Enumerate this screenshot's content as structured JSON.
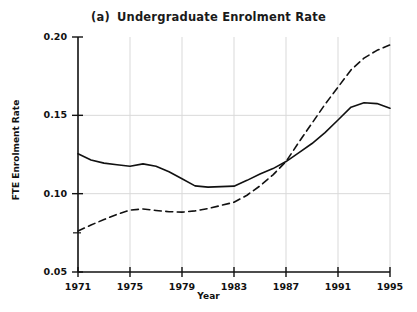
{
  "chart_data": {
    "type": "line",
    "panel_label": "(a)",
    "title_text": "Undergraduate Enrolment Rate",
    "xlabel": "Year",
    "ylabel": "FTE Enrolment Rate",
    "xlim": [
      1971,
      1995
    ],
    "ylim": [
      0.05,
      0.2
    ],
    "xticks": [
      1971,
      1975,
      1979,
      1983,
      1987,
      1991,
      1995
    ],
    "xtick_labels": [
      "1971",
      "1975",
      "1979",
      "1983",
      "1987",
      "1991",
      "1995"
    ],
    "yticks": [
      0.05,
      0.1,
      0.15,
      0.2
    ],
    "ytick_labels": [
      "0.05",
      "0.10",
      "0.15",
      "0.20"
    ],
    "y_minor_ticks": [
      0.075,
      0.125,
      0.175
    ],
    "grid": true,
    "grid_color": "#d9d9d9",
    "legend": "none",
    "x": [
      1971,
      1972,
      1973,
      1974,
      1975,
      1976,
      1977,
      1978,
      1979,
      1980,
      1981,
      1982,
      1983,
      1984,
      1985,
      1986,
      1987,
      1988,
      1989,
      1990,
      1991,
      1992,
      1993,
      1994,
      1995
    ],
    "series": [
      {
        "name": "solid-series",
        "style": "solid",
        "color": "#111111",
        "values": [
          0.1255,
          0.1215,
          0.1195,
          0.1185,
          0.1175,
          0.119,
          0.1175,
          0.114,
          0.1095,
          0.105,
          0.1042,
          0.1045,
          0.1048,
          0.1085,
          0.1125,
          0.116,
          0.1205,
          0.1262,
          0.132,
          0.139,
          0.147,
          0.1552,
          0.158,
          0.1575,
          0.1545
        ]
      },
      {
        "name": "dashed-series",
        "style": "dashed",
        "color": "#111111",
        "values": [
          0.0762,
          0.08,
          0.0835,
          0.0868,
          0.0895,
          0.0902,
          0.0893,
          0.0885,
          0.0882,
          0.089,
          0.0905,
          0.0925,
          0.0945,
          0.099,
          0.105,
          0.112,
          0.1205,
          0.133,
          0.145,
          0.157,
          0.168,
          0.179,
          0.1865,
          0.1915,
          0.195
        ]
      }
    ]
  }
}
